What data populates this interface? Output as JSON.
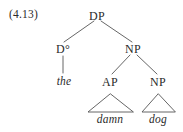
{
  "figure": {
    "example_number": "(4.13)",
    "kind": "syntax-tree",
    "line_color": "#555555",
    "text_color": "#2b2b2b",
    "background_color": "#ffffff"
  },
  "tree": {
    "nodes": {
      "dp": {
        "label": "DP",
        "x": 97,
        "y": 16
      },
      "d0": {
        "label": "D°",
        "x": 63,
        "y": 49
      },
      "np1": {
        "label": "NP",
        "x": 133,
        "y": 49
      },
      "ap": {
        "label": "AP",
        "x": 110,
        "y": 82
      },
      "np2": {
        "label": "NP",
        "x": 158,
        "y": 82
      }
    },
    "terminals": {
      "the": {
        "label": "the",
        "x": 64,
        "y": 82
      },
      "damn": {
        "label": "damn",
        "x": 110,
        "y": 120
      },
      "dog": {
        "label": "dog",
        "x": 158,
        "y": 120
      }
    },
    "branches": [
      {
        "from": "dp",
        "to": "d0",
        "x1": 94,
        "y1": 21,
        "x2": 64,
        "y2": 42
      },
      {
        "from": "dp",
        "to": "np1",
        "x1": 101,
        "y1": 21,
        "x2": 132,
        "y2": 42
      },
      {
        "from": "d0",
        "to": "the",
        "x1": 63,
        "y1": 56,
        "x2": 63,
        "y2": 73
      },
      {
        "from": "np1",
        "to": "ap",
        "x1": 130,
        "y1": 55,
        "x2": 112,
        "y2": 74
      },
      {
        "from": "np1",
        "to": "np2",
        "x1": 137,
        "y1": 55,
        "x2": 157,
        "y2": 74
      }
    ],
    "triangles": [
      {
        "under": "ap",
        "apex_x": 110,
        "apex_y": 94,
        "left_x": 88,
        "right_x": 133,
        "base_y": 112
      },
      {
        "under": "np2",
        "apex_x": 158,
        "apex_y": 94,
        "left_x": 142,
        "right_x": 175,
        "base_y": 112
      }
    ]
  }
}
